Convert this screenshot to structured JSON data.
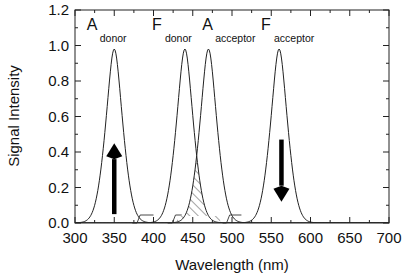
{
  "chart_data": {
    "type": "line",
    "title": "",
    "xlabel": "Wavelength (nm)",
    "ylabel": "Signal Intensity",
    "xlim": [
      300,
      700
    ],
    "ylim": [
      0,
      1.2
    ],
    "grid": false,
    "legend": null,
    "x_ticks": [
      300,
      350,
      400,
      450,
      500,
      550,
      600,
      650,
      700
    ],
    "x_tick_labels": [
      "300",
      "350",
      "400",
      "450",
      "500",
      "550",
      "600",
      "650",
      "700"
    ],
    "y_ticks": [
      0.0,
      0.2,
      0.4,
      0.6,
      0.8,
      1.0,
      1.2
    ],
    "y_tick_labels": [
      "0.0",
      "0.2",
      "0.4",
      "0.6",
      "0.8",
      "1.0",
      "1.2"
    ],
    "series": [
      {
        "name": "A donor",
        "label_main": "A",
        "label_sub": "donor",
        "peak_x": 350,
        "peak_y": 0.98,
        "width_nm": 22,
        "label_x": 315,
        "label_y": 1.09
      },
      {
        "name": "F donor",
        "label_main": "F",
        "label_sub": "donor",
        "peak_x": 440,
        "peak_y": 0.98,
        "width_nm": 22,
        "label_x": 398,
        "label_y": 1.09
      },
      {
        "name": "A acceptor",
        "label_main": "A",
        "label_sub": "acceptor",
        "peak_x": 470,
        "peak_y": 0.98,
        "width_nm": 22,
        "label_x": 462,
        "label_y": 1.09
      },
      {
        "name": "F acceptor",
        "label_main": "F",
        "label_sub": "acceptor",
        "peak_x": 560,
        "peak_y": 0.98,
        "width_nm": 22,
        "label_x": 537,
        "label_y": 1.09
      }
    ],
    "annotations": [
      {
        "type": "arrow",
        "direction": "up",
        "x": 350,
        "y_from": 0.05,
        "y_to": 0.45,
        "meaning": "donor absorption increase"
      },
      {
        "type": "arrow",
        "direction": "down",
        "x": 563,
        "y_from": 0.47,
        "y_to": 0.12,
        "meaning": "acceptor fluorescence decrease"
      },
      {
        "type": "hatched_region",
        "between": [
          "F donor",
          "A acceptor"
        ],
        "x_range": [
          430,
          485
        ],
        "meaning": "spectral overlap"
      }
    ]
  }
}
